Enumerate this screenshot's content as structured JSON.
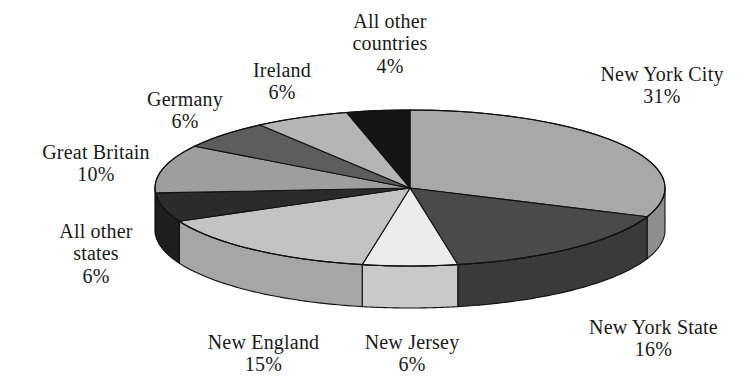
{
  "chart_data": {
    "type": "pie",
    "title": "",
    "subtitle": "",
    "xlabel": "",
    "ylabel": "",
    "legend_position": "none",
    "style": "3d-exploded-none",
    "grid": false,
    "total_percent": 100,
    "start_angle_deg": 90,
    "direction": "clockwise",
    "categories": [
      "New York City",
      "New York State",
      "New Jersey",
      "New England",
      "All other states",
      "Great Britain",
      "Germany",
      "Ireland",
      "All other countries"
    ],
    "values": [
      31,
      16,
      6,
      15,
      6,
      10,
      6,
      6,
      4
    ],
    "value_labels": [
      "31%",
      "16%",
      "6%",
      "15%",
      "6%",
      "10%",
      "6%",
      "6%",
      "4%"
    ],
    "slice_colors": [
      "#a8a8a8",
      "#4a4a4a",
      "#ececec",
      "#c3c3c3",
      "#2b2b2b",
      "#9e9e9e",
      "#5d5d5d",
      "#b5b5b5",
      "#141414"
    ],
    "side_colors": [
      "#8e8e8e",
      "#3a3a3a",
      "#c9c9c9",
      "#a6a6a6",
      "#1e1e1e",
      "#858585",
      "#4a4a4a",
      "#9a9a9a",
      "#0d0d0d"
    ],
    "slices": [
      {
        "label": "New York City",
        "value": 31,
        "value_label": "31%",
        "fill": "#a8a8a8",
        "side": "#8e8e8e",
        "label_x": 577,
        "label_y": 63,
        "label_width": 170,
        "label_align": "center"
      },
      {
        "label": "New York State",
        "value": 16,
        "value_label": "16%",
        "fill": "#4a4a4a",
        "side": "#3a3a3a",
        "label_x": 566,
        "label_y": 316,
        "label_width": 175,
        "label_align": "center"
      },
      {
        "label": "New Jersey",
        "value": 6,
        "value_label": "6%",
        "fill": "#ececec",
        "side": "#c9c9c9",
        "label_x": 342,
        "label_y": 331,
        "label_width": 140,
        "label_align": "center"
      },
      {
        "label": "New England",
        "value": 15,
        "value_label": "15%",
        "fill": "#c3c3c3",
        "side": "#a6a6a6",
        "label_x": 186,
        "label_y": 331,
        "label_width": 155,
        "label_align": "center"
      },
      {
        "label": "All other\nstates",
        "value": 6,
        "value_label": "6%",
        "fill": "#2b2b2b",
        "side": "#1e1e1e",
        "label_x": 36,
        "label_y": 220,
        "label_width": 120,
        "label_align": "center"
      },
      {
        "label": "Great Britain",
        "value": 10,
        "value_label": "10%",
        "fill": "#9e9e9e",
        "side": "#858585",
        "label_x": 22,
        "label_y": 141,
        "label_width": 148,
        "label_align": "center"
      },
      {
        "label": "Germany",
        "value": 6,
        "value_label": "6%",
        "fill": "#5d5d5d",
        "side": "#4a4a4a",
        "label_x": 124,
        "label_y": 88,
        "label_width": 122,
        "label_align": "center"
      },
      {
        "label": "Ireland",
        "value": 6,
        "value_label": "6%",
        "fill": "#b5b5b5",
        "side": "#9a9a9a",
        "label_x": 226,
        "label_y": 59,
        "label_width": 112,
        "label_align": "center"
      },
      {
        "label": "All other\ncountries",
        "value": 4,
        "value_label": "4%",
        "fill": "#141414",
        "side": "#0d0d0d",
        "label_x": 322,
        "label_y": 10,
        "label_width": 136,
        "label_align": "center"
      }
    ],
    "geometry": {
      "center_x": 410,
      "center_y": 188,
      "radius_x": 255,
      "radius_y": 78,
      "depth": 42,
      "stroke": "#111111",
      "stroke_width": 1.1
    },
    "background_color": "#ffffff",
    "text_color": "#1a1a1a"
  }
}
